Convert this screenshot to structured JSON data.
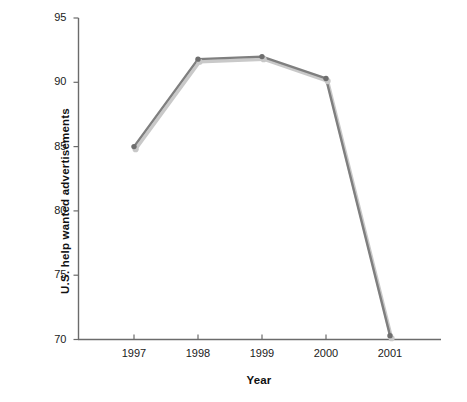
{
  "chart_data": {
    "type": "line",
    "title": "",
    "subtitle": "",
    "xlabel": "Year",
    "ylabel": "U.S. help wanted advertisements",
    "categories": [
      "1997",
      "1998",
      "1999",
      "2000",
      "2001"
    ],
    "x": [
      1997,
      1998,
      1999,
      2000,
      2001
    ],
    "values": [
      85.0,
      91.8,
      92.0,
      90.3,
      70.3
    ],
    "series": [
      {
        "name": "U.S. help wanted advertisements",
        "values": [
          85.0,
          91.8,
          92.0,
          90.3,
          70.3
        ]
      }
    ],
    "xlim": [
      1996.5,
      2001.8
    ],
    "ylim": [
      70,
      95
    ],
    "ytick_labels": [
      "70",
      "75",
      "80",
      "85",
      "90",
      "95"
    ],
    "ytick_values": [
      70,
      75,
      80,
      85,
      90,
      95
    ],
    "xtick_labels": [
      "1997",
      "1998",
      "1999",
      "2000",
      "2001"
    ],
    "grid": false,
    "legend": "none",
    "markers": "circle",
    "annotations": []
  },
  "style": {
    "line_color": "#7f7f7f",
    "line_shadow_color": "#c8c8c8",
    "marker_color": "#6e6e6e",
    "axis_color": "#6b6b6b",
    "text_color": "#1a1a1a",
    "background": "#ffffff"
  }
}
